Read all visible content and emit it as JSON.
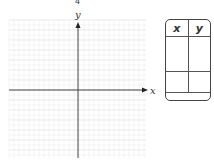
{
  "top_label": "4",
  "plane": {
    "x_axis_label": "x",
    "y_axis_label": "y",
    "grid_color": "#d9d9d9",
    "axis_color": "#444444"
  },
  "table": {
    "headers": [
      "x",
      "y"
    ],
    "rows": [
      [
        "",
        ""
      ],
      [
        "",
        ""
      ]
    ]
  }
}
